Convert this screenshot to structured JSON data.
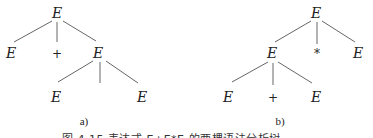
{
  "diagram": {
    "tree_a": {
      "label": "a)",
      "nodes": {
        "root": "E",
        "child_left": "E",
        "child_mid": "+",
        "child_right": "E",
        "grandchild_left": "E",
        "grandchild_right": "E"
      }
    },
    "tree_b": {
      "label": "b)",
      "nodes": {
        "root": "E",
        "child_left": "E",
        "child_mid": "*",
        "child_right": "E",
        "grandchild_left": "E",
        "grandchild_mid": "+",
        "grandchild_right": "E"
      }
    },
    "caption": "图 4.15  表达式 E+E*E 的两棵语法分析树"
  },
  "colors": {
    "line": "#555555",
    "text": "#222222",
    "background": "#ffffff"
  }
}
